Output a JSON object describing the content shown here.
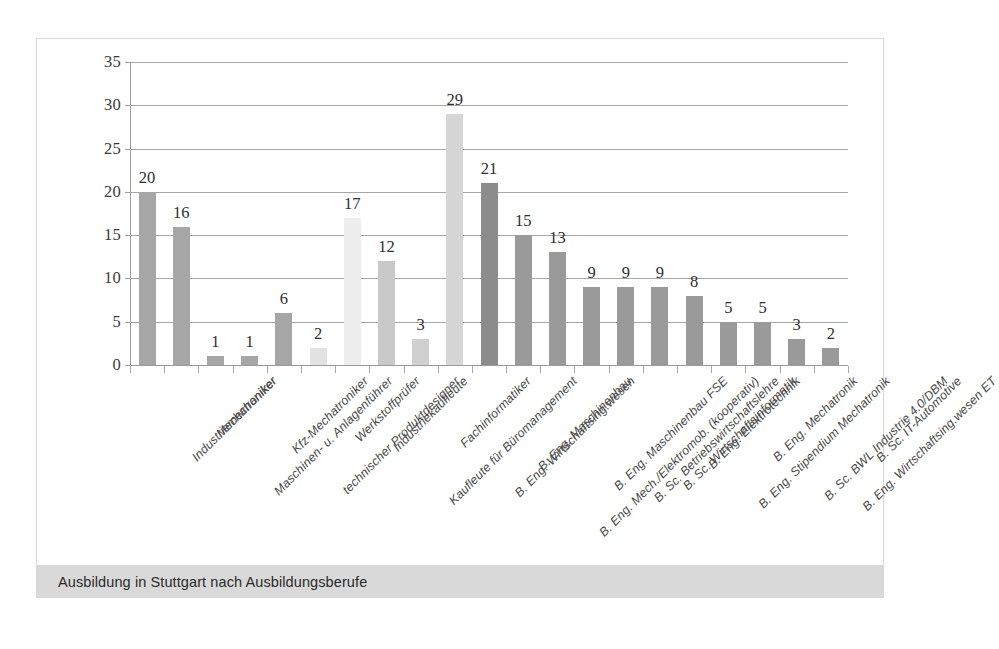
{
  "caption": "Ausbildung in Stuttgart nach Ausbildungsberufe",
  "colors": {
    "bar_medium": "#a6a6a6",
    "bar_light": "#ededed",
    "bar_light2": "#d3d3d3",
    "bar_dark": "#8c8c8c",
    "gridline": "#a6a6a6",
    "axis": "#a0a0a0",
    "caption_band": "#d9d9d9",
    "frame": "#d7d7d7",
    "text": "#3b3b3b"
  },
  "chart_data": {
    "type": "bar",
    "title": "",
    "xlabel": "",
    "ylabel": "",
    "ylim": [
      0,
      35
    ],
    "yticks": [
      0,
      5,
      10,
      15,
      20,
      25,
      30,
      35
    ],
    "grid": true,
    "legend": false,
    "categories": [
      "Industriemechaniker",
      "Mechatroniker",
      "Maschinen- u. Anlagenführer",
      "Kfz-Mechatroniker",
      "technischer Produktdesigner",
      "Werkstoffprüfer",
      "Industriekaufleute",
      "Kaufleute für Büromanagement",
      "Fachinformatiker",
      "B. Eng. Wirtschaftsing.wesen",
      "B. Eng. Maschinenbau",
      "B. Eng. Mech./Elektromob. (kooperativ)",
      "B. Eng. Maschinenbau FSE",
      "B. Sc. Betriebswirtschaftslehre",
      "B. Sc. Wirtschaftsinformatik",
      "B. Eng. Elektrotechnik",
      "B. Eng. Stipendium Mechatronik",
      "B. Eng. Mechatronik",
      "B. Sc. BWL Industrie 4.0/DBM",
      "B. Eng. Wirtschaftsing.wesen ET",
      "B. Sc. IT-Automotive"
    ],
    "values": [
      20,
      16,
      1,
      1,
      6,
      2,
      17,
      12,
      3,
      29,
      21,
      15,
      13,
      9,
      9,
      9,
      8,
      5,
      5,
      3,
      2
    ],
    "bar_shades": [
      "#a6a6a6",
      "#a6a6a6",
      "#a6a6a6",
      "#a6a6a6",
      "#a6a6a6",
      "#e2e2e2",
      "#ededed",
      "#c9c9c9",
      "#d0d0d0",
      "#d6d6d6",
      "#8c8c8c",
      "#9a9a9a",
      "#9a9a9a",
      "#9a9a9a",
      "#9a9a9a",
      "#9a9a9a",
      "#9a9a9a",
      "#9a9a9a",
      "#9a9a9a",
      "#9a9a9a",
      "#9a9a9a"
    ]
  }
}
